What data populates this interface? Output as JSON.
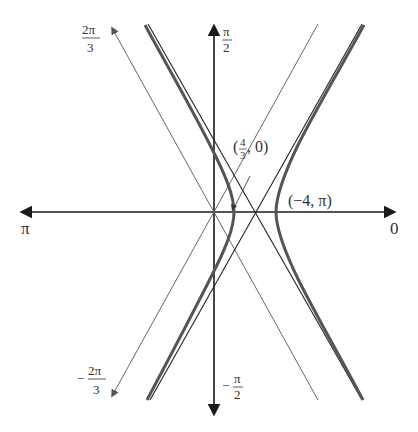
{
  "figure": {
    "type": "polar-conic-graph",
    "axis_labels": {
      "right": "0",
      "left": "π",
      "top_num": "π",
      "top_den": "2",
      "bottom_sign": "−",
      "bottom_num": "π",
      "bottom_den": "2",
      "upper_left_num": "2π",
      "upper_left_den": "3",
      "lower_left_sign": "−",
      "lower_left_num": "2π",
      "lower_left_den": "3"
    },
    "points": [
      {
        "label_open": "(",
        "frac_num": "4",
        "frac_den": "3",
        "label_rest": ", 0)",
        "meaning": "vertex (4/3, 0)"
      },
      {
        "label": "(−4, π)",
        "meaning": "vertex (−4, π)"
      }
    ],
    "colors": {
      "axis": "#1a1a1a",
      "curve": "#555555",
      "asymptote": "#222222",
      "ray": "#666666",
      "text": "#333333"
    }
  }
}
